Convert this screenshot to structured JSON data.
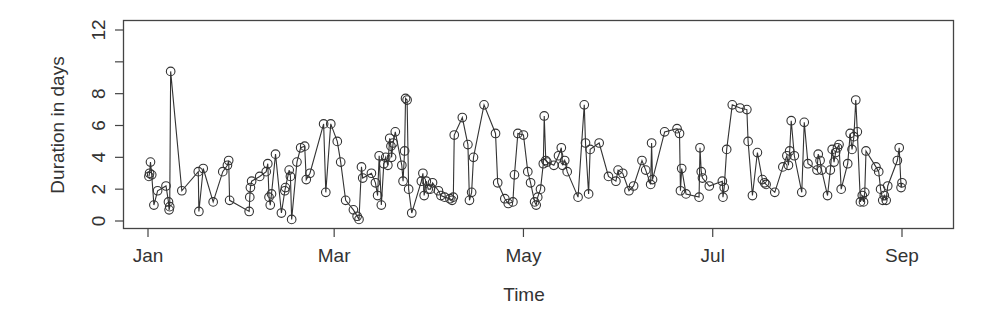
{
  "chart_data": {
    "type": "line",
    "title": "",
    "xlabel": "Time",
    "ylabel": "Duration in days",
    "x_tick_labels": [
      "Jan",
      "Mar",
      "May",
      "Jul",
      "Sep"
    ],
    "x_tick_days": [
      1,
      61,
      122,
      183,
      244
    ],
    "y_ticks": [
      0,
      2,
      4,
      6,
      8,
      10,
      12
    ],
    "y_tick_labels": [
      "0",
      "2",
      "4",
      "6",
      "8",
      "",
      "12"
    ],
    "xlim_days": [
      -7,
      258
    ],
    "ylim": [
      -0.5,
      12.6
    ],
    "grid": false,
    "legend": null,
    "marker": "open-circle",
    "line_color": "#333333",
    "series": [
      {
        "name": "Duration",
        "x_day": [
          1.3,
          1.5,
          1.8,
          2.2,
          2.9,
          4.1,
          6.8,
          7.6,
          7.8,
          8.0,
          8.3,
          11.9,
          17.2,
          17.4,
          18.8,
          22.0,
          25.1,
          26.6,
          27.0,
          27.3,
          33.6,
          33.8,
          34.0,
          34.4,
          37.0,
          39.1,
          39.6,
          40.0,
          40.4,
          40.8,
          42.1,
          44.0,
          45.1,
          45.3,
          46.5,
          46.9,
          47.3,
          49.0,
          50.2,
          51.5,
          52.0,
          53.2,
          57.6,
          58.3,
          59.9,
          62.0,
          63.1,
          64.7,
          67.2,
          68.4,
          69.0,
          69.8,
          70.2,
          73.0,
          74.3,
          75.0,
          75.5,
          76.2,
          77.0,
          77.6,
          78.3,
          78.9,
          79.3,
          79.5,
          80.0,
          80.7,
          82.8,
          83.2,
          83.7,
          84.0,
          84.5,
          85.0,
          86.0,
          89.1,
          89.6,
          90.0,
          90.7,
          91.3,
          92.0,
          92.7,
          94.6,
          95.4,
          96.6,
          98.3,
          99.0,
          99.4,
          99.7,
          102.3,
          104.1,
          104.6,
          105.3,
          105.9,
          109.3,
          113.0,
          113.7,
          116.0,
          117.1,
          118.6,
          119.1,
          120.2,
          122.0,
          123.4,
          124.3,
          125.6,
          126.1,
          126.6,
          127.5,
          128.4,
          128.7,
          129.2,
          129.6,
          131.8,
          133.3,
          134.2,
          134.6,
          135.3,
          136.1,
          139.6,
          141.6,
          142.0,
          143.0,
          143.5,
          146.4,
          149.4,
          151.8,
          152.5,
          154.0,
          156.0,
          157.5,
          160.2,
          161.4,
          163.0,
          163.3,
          163.6,
          167.5,
          171.5,
          172.3,
          172.6,
          173.0,
          174.4,
          178.6,
          178.9,
          179.3,
          179.7,
          181.9,
          186.1,
          186.3,
          186.7,
          187.5,
          189.3,
          191.8,
          194.0,
          194.4,
          195.8,
          197.4,
          199.0,
          199.7,
          200.2,
          203.0,
          205.6,
          206.9,
          207.4,
          207.8,
          208.3,
          209.3,
          211.7,
          212.5,
          213.7,
          216.6,
          217.0,
          217.6,
          218.1,
          220.0,
          220.9,
          221.5,
          222.1,
          222.6,
          223.2,
          223.7,
          224.4,
          226.5,
          227.3,
          227.9,
          228.5,
          229.1,
          229.6,
          230.6,
          231.2,
          231.6,
          232.0,
          232.4,
          235.6,
          236.5,
          237.1,
          237.8,
          238.3,
          238.9,
          239.4,
          242.5,
          243.1,
          243.7,
          244.0
        ],
        "values": [
          2.8,
          3.0,
          3.7,
          2.9,
          1.0,
          1.9,
          2.2,
          1.2,
          0.7,
          0.9,
          9.4,
          1.9,
          3.1,
          0.6,
          3.3,
          1.2,
          3.1,
          3.5,
          3.8,
          1.3,
          0.6,
          1.5,
          2.1,
          2.5,
          2.8,
          3.1,
          3.6,
          1.5,
          1.0,
          1.7,
          4.2,
          0.5,
          1.9,
          2.1,
          3.2,
          2.8,
          0.1,
          3.7,
          4.6,
          4.7,
          2.6,
          3.0,
          6.1,
          1.8,
          6.1,
          5.0,
          3.7,
          1.3,
          0.7,
          0.3,
          0.1,
          3.4,
          2.7,
          3.0,
          2.4,
          1.6,
          4.1,
          1.0,
          3.6,
          4.0,
          3.5,
          5.2,
          4.7,
          4.0,
          4.9,
          5.6,
          3.5,
          2.5,
          4.4,
          7.7,
          7.6,
          2.0,
          0.5,
          2.5,
          3.0,
          1.6,
          2.5,
          2.0,
          2.0,
          2.4,
          1.9,
          1.6,
          1.5,
          1.4,
          1.3,
          1.5,
          5.4,
          6.5,
          4.8,
          1.3,
          1.8,
          4.0,
          7.3,
          5.5,
          2.4,
          1.4,
          1.1,
          1.2,
          2.9,
          5.5,
          5.4,
          3.1,
          2.4,
          1.2,
          1.0,
          1.5,
          2.0,
          3.6,
          6.6,
          3.8,
          3.7,
          3.5,
          4.1,
          4.6,
          3.5,
          3.8,
          3.1,
          1.5,
          7.3,
          4.9,
          1.7,
          4.5,
          4.9,
          2.8,
          2.5,
          3.2,
          3.0,
          1.9,
          2.2,
          3.8,
          3.2,
          2.3,
          4.9,
          2.6,
          5.6,
          5.8,
          5.5,
          1.9,
          3.3,
          1.7,
          1.5,
          4.6,
          3.1,
          2.7,
          2.2,
          2.5,
          1.5,
          2.1,
          4.5,
          7.3,
          7.1,
          7.0,
          5.0,
          1.6,
          4.3,
          2.6,
          2.4,
          2.3,
          1.8,
          3.4,
          4.1,
          3.5,
          4.4,
          6.3,
          4.1,
          1.8,
          6.2,
          3.6,
          3.2,
          4.2,
          3.8,
          3.2,
          1.6,
          3.2,
          4.5,
          3.7,
          4.3,
          4.6,
          4.8,
          2.0,
          3.6,
          5.5,
          4.5,
          5.3,
          7.6,
          5.6,
          1.2,
          1.6,
          1.2,
          1.8,
          4.4,
          3.4,
          3.1,
          2.0,
          1.3,
          1.6,
          1.3,
          2.2,
          3.8,
          4.6,
          2.1,
          2.4,
          0.9,
          6.6,
          5.8,
          4.8,
          3.6,
          5.0,
          5.9,
          6.0,
          5.9
        ]
      }
    ]
  }
}
